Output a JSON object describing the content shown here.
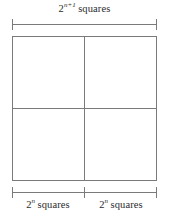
{
  "figure": {
    "type": "geometric-diagram",
    "background_color": "#ffffff",
    "line_color": "#7a7a7a",
    "text_color": "#2b2b2b",
    "width": 169,
    "height": 218
  },
  "labels": {
    "top": {
      "base": "2",
      "exponent": "n+1",
      "word": "squares",
      "full_text": "2^(n+1) squares"
    },
    "bottom_left": {
      "base": "2",
      "exponent": "n",
      "word": "squares",
      "full_text": "2^n squares"
    },
    "bottom_right": {
      "base": "2",
      "exponent": "n",
      "word": "squares",
      "full_text": "2^n squares"
    }
  },
  "brackets": {
    "top": {
      "segments": 1,
      "spans": [
        "2^(n+1) squares"
      ]
    },
    "bottom": {
      "segments": 2,
      "spans": [
        "2^n squares",
        "2^n squares"
      ]
    }
  },
  "square": {
    "subdivisions": "2x2",
    "quadrants": [
      "top-left",
      "top-right",
      "bottom-left",
      "bottom-right"
    ]
  }
}
